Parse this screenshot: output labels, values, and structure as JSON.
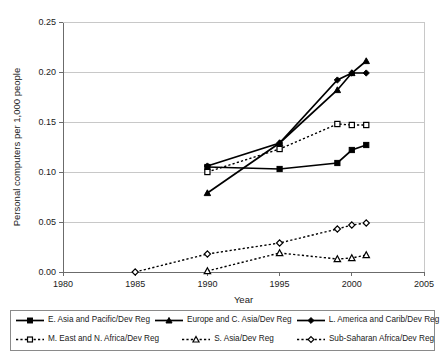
{
  "chart_data": {
    "type": "line",
    "title": "",
    "xlabel": "Year",
    "ylabel": "Personal computers per 1,000 people",
    "xlim": [
      1980,
      2005
    ],
    "ylim": [
      0.0,
      0.25
    ],
    "xticks": [
      1980,
      1985,
      1990,
      1995,
      2000,
      2005
    ],
    "xtick_labels": [
      "1980",
      "1985",
      "1990",
      "1995",
      "2000",
      "2005"
    ],
    "yticks": [
      0.0,
      0.05,
      0.1,
      0.15,
      0.2,
      0.25
    ],
    "ytick_labels": [
      "0.00",
      "0.05",
      "0.10",
      "0.15",
      "0.20",
      "0.25"
    ],
    "grid": "horizontal",
    "legend_position": "bottom",
    "series": [
      {
        "name": "E. Asia and Pacific/Dev Reg",
        "marker": "square-filled",
        "style": "solid",
        "x": [
          1990,
          1995,
          1999,
          2000,
          2001
        ],
        "values": [
          0.105,
          0.103,
          0.109,
          0.122,
          0.127
        ]
      },
      {
        "name": "Europe and C. Asia/Dev Reg",
        "marker": "triangle-filled",
        "style": "solid",
        "x": [
          1990,
          1995,
          1999,
          2000,
          2001
        ],
        "values": [
          0.079,
          0.129,
          0.182,
          0.199,
          0.211
        ]
      },
      {
        "name": "L. America and Carib/Dev Reg",
        "marker": "diamond-filled",
        "style": "solid",
        "x": [
          1990,
          1995,
          1999,
          2000,
          2001
        ],
        "values": [
          0.106,
          0.129,
          0.192,
          0.199,
          0.199
        ]
      },
      {
        "name": "M. East and N. Africa/Dev Reg",
        "marker": "square-open",
        "style": "dotted",
        "x": [
          1990,
          1995,
          1999,
          2000,
          2001
        ],
        "values": [
          0.1,
          0.123,
          0.148,
          0.147,
          0.147
        ]
      },
      {
        "name": "S. Asia/Dev Reg",
        "marker": "triangle-open",
        "style": "dotted",
        "x": [
          1990,
          1995,
          1999,
          2000,
          2001
        ],
        "values": [
          0.001,
          0.019,
          0.013,
          0.014,
          0.017
        ]
      },
      {
        "name": "Sub-Saharan Africa/Dev Reg",
        "marker": "diamond-open",
        "style": "dotted",
        "x": [
          1985,
          1990,
          1995,
          1999,
          2000,
          2001
        ],
        "values": [
          0.0,
          0.018,
          0.029,
          0.043,
          0.047,
          0.049
        ]
      }
    ]
  },
  "legend": {
    "rows": [
      [
        {
          "label": "E. Asia and Pacific/Dev Reg",
          "marker": "square-filled",
          "style": "solid"
        },
        {
          "label": "Europe and C. Asia/Dev Reg",
          "marker": "triangle-filled",
          "style": "solid"
        },
        {
          "label": "L. America and Carib/Dev Reg",
          "marker": "diamond-filled",
          "style": "solid"
        }
      ],
      [
        {
          "label": "M. East and N. Africa/Dev Reg",
          "marker": "square-open",
          "style": "dotted"
        },
        {
          "label": "S. Asia/Dev Reg",
          "marker": "triangle-open",
          "style": "dotted"
        },
        {
          "label": "Sub-Saharan Africa/Dev Reg",
          "marker": "diamond-open",
          "style": "dotted"
        }
      ]
    ]
  },
  "colors": {
    "line": "#000000",
    "grid": "#c8c8c8",
    "axis": "#6b6b6b",
    "background": "#ffffff",
    "marker_fill_open": "#ffffff"
  }
}
